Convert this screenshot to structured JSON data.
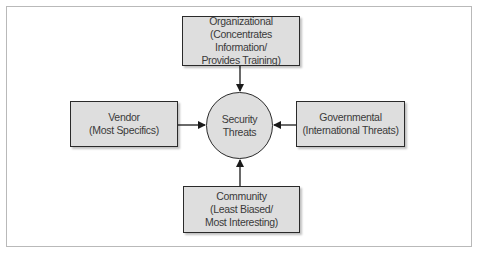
{
  "diagram": {
    "center": {
      "lines": [
        "Security",
        "Threats"
      ]
    },
    "nodes": {
      "top": {
        "lines": [
          "Organizational",
          "(Concentrates Information/",
          "Provides Training)"
        ]
      },
      "left": {
        "lines": [
          "Vendor",
          "(Most Specifics)"
        ]
      },
      "right": {
        "lines": [
          "Governmental",
          "(International Threats)"
        ]
      },
      "bottom": {
        "lines": [
          "Community",
          "(Least Biased/",
          "Most Interesting)"
        ]
      }
    },
    "edges": [
      {
        "from": "top",
        "to": "center"
      },
      {
        "from": "left",
        "to": "center"
      },
      {
        "from": "right",
        "to": "center"
      },
      {
        "from": "bottom",
        "to": "center"
      }
    ],
    "colors": {
      "node_fill": "#dedede",
      "stroke": "#2a2a2a",
      "frame": "#b9b9b9"
    }
  }
}
